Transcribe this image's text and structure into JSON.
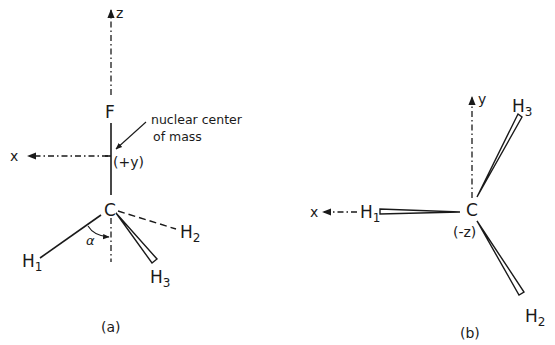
{
  "figure": {
    "panel_a": {
      "caption": "(a)",
      "axes": {
        "z_label": "z",
        "x_label": "x",
        "y_note": "(+y)"
      },
      "atoms": {
        "F": "F",
        "C": "C",
        "H1": {
          "base": "H",
          "sub": "1"
        },
        "H2": {
          "base": "H",
          "sub": "2"
        },
        "H3": {
          "base": "H",
          "sub": "3"
        }
      },
      "angle_label": "α",
      "annotation": {
        "line1": "nuclear center",
        "line2": "of mass"
      }
    },
    "panel_b": {
      "caption": "(b)",
      "axes": {
        "y_label": "y",
        "x_label": "x",
        "z_note": "(-z)"
      },
      "atoms": {
        "C": "C",
        "H1": {
          "base": "H",
          "sub": "1"
        },
        "H2": {
          "base": "H",
          "sub": "2"
        },
        "H3": {
          "base": "H",
          "sub": "3"
        }
      }
    }
  }
}
